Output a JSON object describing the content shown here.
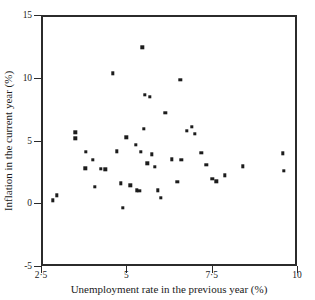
{
  "chart_data": {
    "type": "scatter",
    "title": "",
    "xlabel": "Unemployment rate in the previous year (%)",
    "ylabel": "Inflation in the current year (%)",
    "xlim": [
      2.5,
      10
    ],
    "ylim": [
      -5,
      15
    ],
    "xticks": [
      2.5,
      5,
      7.5,
      10
    ],
    "yticks": [
      -5,
      0,
      5,
      10,
      15
    ],
    "xtick_labels": [
      "2·5",
      "5",
      "7·5",
      "10"
    ],
    "ytick_labels": [
      "-5",
      "0",
      "5",
      "10",
      "15"
    ],
    "grid": false,
    "legend": null,
    "marker_color": "#1c1c1c",
    "axis_color": "#2b2b2b",
    "background": "#ffffff",
    "series": [
      {
        "name": "Inflation vs unemployment",
        "x": [
          2.79,
          2.91,
          3.45,
          3.45,
          3.74,
          3.76,
          3.96,
          4.01,
          4.19,
          4.33,
          4.55,
          4.66,
          4.78,
          4.83,
          4.94,
          5.06,
          5.22,
          5.25,
          5.32,
          5.37,
          5.41,
          5.45,
          5.48,
          5.55,
          5.62,
          5.68,
          5.77,
          5.86,
          5.95,
          6.08,
          6.28,
          6.43,
          6.52,
          6.55,
          6.72,
          6.86,
          6.95,
          7.14,
          7.28,
          7.46,
          7.58,
          7.82,
          8.35,
          9.52,
          9.55
        ],
        "y": [
          0.4,
          0.8,
          5.8,
          5.35,
          2.95,
          4.25,
          3.6,
          1.45,
          2.9,
          2.85,
          10.5,
          4.3,
          1.75,
          -0.2,
          5.4,
          1.6,
          4.8,
          1.2,
          1.15,
          4.25,
          12.6,
          6.1,
          8.8,
          3.35,
          8.65,
          4.05,
          3.05,
          1.2,
          0.6,
          7.35,
          3.65,
          1.85,
          10.0,
          3.6,
          5.95,
          6.25,
          5.7,
          4.2,
          3.2,
          2.1,
          1.9,
          2.4,
          3.1,
          4.15,
          2.75
        ]
      }
    ]
  }
}
